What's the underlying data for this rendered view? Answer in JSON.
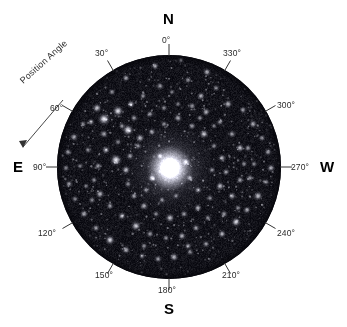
{
  "figure": {
    "annotation_label": "Position Angle",
    "cardinals": [
      {
        "name": "north",
        "label": "N"
      },
      {
        "name": "east",
        "label": "E"
      },
      {
        "name": "south",
        "label": "S"
      },
      {
        "name": "west",
        "label": "W"
      }
    ],
    "degree_labels": [
      {
        "name": "tick-0",
        "label": "0°"
      },
      {
        "name": "tick-30",
        "label": "30°"
      },
      {
        "name": "tick-60",
        "label": "60°"
      },
      {
        "name": "tick-90",
        "label": "90°"
      },
      {
        "name": "tick-120",
        "label": "120°"
      },
      {
        "name": "tick-150",
        "label": "150°"
      },
      {
        "name": "tick-180",
        "label": "180°"
      },
      {
        "name": "tick-210",
        "label": "210°"
      },
      {
        "name": "tick-240",
        "label": "240°"
      },
      {
        "name": "tick-270",
        "label": "270°"
      },
      {
        "name": "tick-300",
        "label": "300°"
      },
      {
        "name": "tick-330",
        "label": "330°"
      }
    ],
    "colors": {
      "background": "#ffffff",
      "field": "#05050a",
      "tick": "#333333",
      "text": "#2a2a2a",
      "cardinal_text": "#000000"
    }
  },
  "chart_data": {
    "type": "scatter",
    "title": "",
    "xlabel": "",
    "ylabel": "",
    "grid": false,
    "legend": "none",
    "coordinate_system": "polar-position-angle",
    "angle_unit": "degrees",
    "angle_start": "North (0°) at top",
    "angle_direction": "counterclockwise toward East (90°) at left",
    "tick_interval_deg": 30,
    "tick_values_deg": [
      0,
      30,
      60,
      90,
      120,
      150,
      180,
      210,
      240,
      270,
      300,
      330
    ],
    "cardinal_angles_deg": {
      "N": 0,
      "E": 90,
      "S": 180,
      "W": 270
    },
    "field_center_px": [
      169,
      167
    ],
    "field_radius_px": 112,
    "objects": [
      {
        "name": "galaxy-nucleus",
        "type": "galaxy",
        "cx": 170,
        "cy": 168,
        "r": 9,
        "brightness": 1.0
      },
      {
        "name": "galaxy-halo",
        "type": "halo",
        "cx": 170,
        "cy": 168,
        "r": 52,
        "brightness": 0.35
      }
    ],
    "stars": [
      [
        155,
        66,
        1.4,
        0.7
      ],
      [
        181,
        60,
        1.2,
        0.55
      ],
      [
        207,
        72,
        1.5,
        0.72
      ],
      [
        232,
        70,
        2.4,
        1.0
      ],
      [
        247,
        84,
        1.3,
        0.6
      ],
      [
        126,
        78,
        1.4,
        0.66
      ],
      [
        112,
        92,
        1.3,
        0.58
      ],
      [
        97,
        108,
        1.7,
        0.8
      ],
      [
        91,
        122,
        1.4,
        0.62
      ],
      [
        104,
        119,
        2.3,
        0.95
      ],
      [
        118,
        111,
        2.0,
        0.88
      ],
      [
        131,
        104,
        1.5,
        0.7
      ],
      [
        143,
        96,
        1.3,
        0.55
      ],
      [
        160,
        86,
        1.4,
        0.62
      ],
      [
        172,
        92,
        1.2,
        0.52
      ],
      [
        188,
        80,
        1.3,
        0.58
      ],
      [
        201,
        96,
        1.5,
        0.7
      ],
      [
        216,
        88,
        1.3,
        0.56
      ],
      [
        228,
        104,
        1.6,
        0.74
      ],
      [
        243,
        110,
        1.4,
        0.62
      ],
      [
        253,
        124,
        1.5,
        0.68
      ],
      [
        262,
        138,
        1.3,
        0.58
      ],
      [
        268,
        152,
        1.4,
        0.63
      ],
      [
        271,
        168,
        1.5,
        0.7
      ],
      [
        266,
        182,
        1.3,
        0.56
      ],
      [
        258,
        196,
        1.7,
        0.78
      ],
      [
        247,
        210,
        1.4,
        0.64
      ],
      [
        236,
        222,
        1.8,
        0.82
      ],
      [
        222,
        234,
        1.5,
        0.7
      ],
      [
        206,
        244,
        1.4,
        0.62
      ],
      [
        190,
        252,
        1.3,
        0.58
      ],
      [
        174,
        257,
        1.6,
        0.74
      ],
      [
        158,
        259,
        1.4,
        0.64
      ],
      [
        142,
        256,
        1.3,
        0.56
      ],
      [
        126,
        250,
        1.5,
        0.7
      ],
      [
        110,
        240,
        1.8,
        0.84
      ],
      [
        96,
        228,
        1.4,
        0.62
      ],
      [
        84,
        214,
        1.5,
        0.68
      ],
      [
        75,
        199,
        1.3,
        0.56
      ],
      [
        69,
        184,
        1.4,
        0.62
      ],
      [
        66,
        168,
        1.3,
        0.55
      ],
      [
        68,
        152,
        1.4,
        0.62
      ],
      [
        74,
        137,
        1.5,
        0.68
      ],
      [
        83,
        124,
        1.3,
        0.56
      ],
      [
        128,
        130,
        2.1,
        0.92
      ],
      [
        140,
        138,
        1.6,
        0.74
      ],
      [
        152,
        132,
        1.4,
        0.62
      ],
      [
        164,
        124,
        1.3,
        0.56
      ],
      [
        178,
        118,
        1.5,
        0.7
      ],
      [
        192,
        126,
        1.4,
        0.62
      ],
      [
        204,
        134,
        1.7,
        0.78
      ],
      [
        214,
        146,
        1.3,
        0.56
      ],
      [
        222,
        158,
        1.5,
        0.68
      ],
      [
        226,
        172,
        1.4,
        0.62
      ],
      [
        220,
        186,
        1.6,
        0.74
      ],
      [
        210,
        198,
        1.3,
        0.56
      ],
      [
        198,
        208,
        1.5,
        0.7
      ],
      [
        184,
        214,
        1.4,
        0.62
      ],
      [
        170,
        218,
        1.7,
        0.78
      ],
      [
        156,
        214,
        1.3,
        0.56
      ],
      [
        144,
        206,
        1.5,
        0.68
      ],
      [
        134,
        196,
        1.4,
        0.62
      ],
      [
        128,
        184,
        1.3,
        0.56
      ],
      [
        126,
        170,
        1.6,
        0.74
      ],
      [
        130,
        156,
        1.4,
        0.62
      ],
      [
        138,
        146,
        1.3,
        0.55
      ],
      [
        116,
        160,
        2.2,
        0.94
      ],
      [
        106,
        150,
        1.5,
        0.7
      ],
      [
        98,
        166,
        1.4,
        0.62
      ],
      [
        94,
        180,
        1.3,
        0.56
      ],
      [
        100,
        194,
        1.6,
        0.74
      ],
      [
        110,
        206,
        1.4,
        0.62
      ],
      [
        122,
        216,
        1.5,
        0.68
      ],
      [
        136,
        226,
        1.8,
        0.84
      ],
      [
        150,
        234,
        1.4,
        0.62
      ],
      [
        166,
        238,
        1.3,
        0.56
      ],
      [
        182,
        236,
        1.5,
        0.7
      ],
      [
        196,
        228,
        1.4,
        0.62
      ],
      [
        208,
        218,
        1.3,
        0.56
      ],
      [
        232,
        196,
        1.5,
        0.68
      ],
      [
        240,
        180,
        1.4,
        0.62
      ],
      [
        244,
        164,
        1.3,
        0.56
      ],
      [
        240,
        148,
        1.6,
        0.74
      ],
      [
        232,
        134,
        1.4,
        0.62
      ],
      [
        220,
        122,
        1.3,
        0.56
      ],
      [
        206,
        112,
        1.5,
        0.7
      ],
      [
        192,
        106,
        1.4,
        0.6
      ],
      [
        178,
        104,
        1.2,
        0.5
      ],
      [
        164,
        108,
        1.3,
        0.54
      ],
      [
        150,
        114,
        1.4,
        0.6
      ],
      [
        88,
        150,
        1.3,
        0.56
      ],
      [
        80,
        166,
        1.2,
        0.52
      ],
      [
        152,
        178,
        1.6,
        0.76
      ],
      [
        186,
        162,
        1.5,
        0.7
      ],
      [
        190,
        178,
        1.4,
        0.64
      ],
      [
        160,
        156,
        1.3,
        0.56
      ],
      [
        198,
        190,
        1.4,
        0.62
      ],
      [
        146,
        190,
        1.3,
        0.56
      ],
      [
        176,
        196,
        1.2,
        0.52
      ],
      [
        162,
        200,
        1.3,
        0.55
      ],
      [
        212,
        170,
        1.3,
        0.56
      ],
      [
        104,
        134,
        1.5,
        0.68
      ],
      [
        118,
        142,
        1.3,
        0.55
      ],
      [
        248,
        148,
        1.4,
        0.62
      ],
      [
        254,
        164,
        1.3,
        0.55
      ],
      [
        250,
        178,
        1.4,
        0.6
      ],
      [
        238,
        208,
        1.3,
        0.55
      ],
      [
        224,
        214,
        1.4,
        0.6
      ],
      [
        92,
        200,
        1.3,
        0.55
      ],
      [
        86,
        186,
        1.2,
        0.5
      ],
      [
        144,
        246,
        1.3,
        0.56
      ],
      [
        188,
        246,
        1.4,
        0.6
      ],
      [
        214,
        126,
        1.2,
        0.5
      ],
      [
        200,
        118,
        1.3,
        0.54
      ],
      [
        134,
        118,
        1.4,
        0.6
      ],
      [
        122,
        126,
        1.3,
        0.55
      ]
    ]
  }
}
